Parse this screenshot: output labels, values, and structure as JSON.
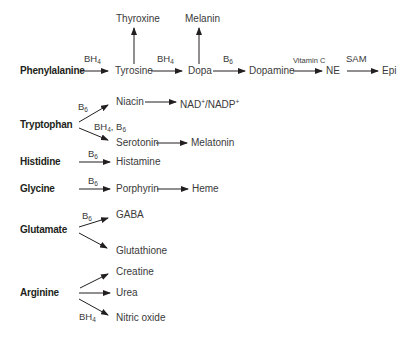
{
  "pathways": {
    "phenylalanine": {
      "source": "Phenylalanine",
      "tyrosine": "Tyrosine",
      "thyroxine": "Thyroxine",
      "dopa": "Dopa",
      "melanin": "Melanin",
      "dopamine": "Dopamine",
      "ne": "NE",
      "epi": "Epi",
      "cof_tyrosine": "BH",
      "cof_tyrosine_sub": "4",
      "cof_dopa": "BH",
      "cof_dopa_sub": "4",
      "cof_dopamine": "B",
      "cof_dopamine_sub": "6",
      "cof_ne": "Vitamin C",
      "cof_epi": "SAM"
    },
    "tryptophan": {
      "source": "Tryptophan",
      "niacin": "Niacin",
      "nad": "NAD",
      "nad_sup": "+",
      "nad_sep": "/NADP",
      "nadp_sup": "+",
      "serotonin": "Serotonin",
      "melatonin": "Melatonin",
      "cof_niacin": "B",
      "cof_niacin_sub": "6",
      "cof_serotonin_a": "BH",
      "cof_serotonin_a_sub": "4",
      "cof_serotonin_b": ", B",
      "cof_serotonin_b_sub": "6"
    },
    "histidine": {
      "source": "Histidine",
      "histamine": "Histamine",
      "cof": "B",
      "cof_sub": "6"
    },
    "glycine": {
      "source": "Glycine",
      "porphyrin": "Porphyrin",
      "heme": "Heme",
      "cof": "B",
      "cof_sub": "6"
    },
    "glutamate": {
      "source": "Glutamate",
      "gaba": "GABA",
      "glutathione": "Glutathione",
      "cof": "B",
      "cof_sub": "6"
    },
    "arginine": {
      "source": "Arginine",
      "creatine": "Creatine",
      "urea": "Urea",
      "nitric_oxide": "Nitric oxide",
      "cof": "BH",
      "cof_sub": "4"
    }
  },
  "colors": {
    "text": "#231f20",
    "arrow": "#231f20",
    "background": "#ffffff"
  }
}
